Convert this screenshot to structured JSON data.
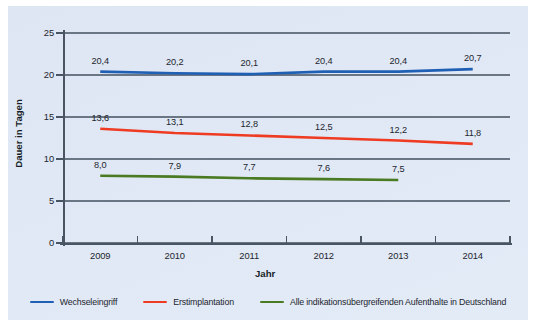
{
  "chart_data": {
    "type": "line",
    "title": "",
    "xlabel": "Jahr",
    "ylabel": "Dauer in Tagen",
    "categories": [
      "2009",
      "2010",
      "2011",
      "2012",
      "2013",
      "2014"
    ],
    "ylim": [
      0,
      25
    ],
    "yticks": [
      "0",
      "5",
      "10",
      "15",
      "20",
      "25"
    ],
    "grid": true,
    "legend_position": "bottom",
    "series": [
      {
        "name": "Wechseleingriff",
        "color": "#1f5fb4",
        "values": [
          20.4,
          20.2,
          20.1,
          20.4,
          20.4,
          20.7
        ],
        "labels": [
          "20,4",
          "20,2",
          "20,1",
          "20,4",
          "20,4",
          "20,7"
        ]
      },
      {
        "name": "Erstimplantation",
        "color": "#ef3b22",
        "values": [
          13.6,
          13.1,
          12.8,
          12.5,
          12.2,
          11.8
        ],
        "labels": [
          "13,6",
          "13,1",
          "12,8",
          "12,5",
          "12,2",
          "11,8"
        ]
      },
      {
        "name": "Alle indikationsübergreifenden Aufenthalte in Deutschland",
        "color": "#4a7a22",
        "values": [
          8.0,
          7.9,
          7.7,
          7.6,
          7.5,
          null
        ],
        "labels": [
          "8,0",
          "7,9",
          "7,7",
          "7,6",
          "7,5",
          ""
        ]
      }
    ]
  },
  "colors": {
    "panel_background": "#dfe8f4",
    "axis": "#4a5563",
    "grid": "#6b7684",
    "text": "#1d252e",
    "series_blue": "#1f5fb4",
    "series_red": "#ef3b22",
    "series_green": "#4a7a22"
  }
}
